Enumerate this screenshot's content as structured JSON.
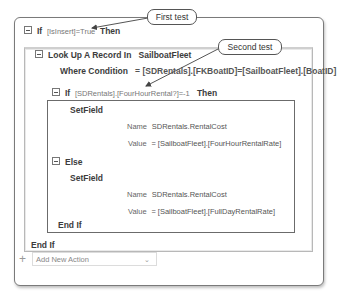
{
  "macro": {
    "if1": {
      "keyword": "If",
      "condition": "[IsInsert]=True",
      "then": "Then"
    },
    "lookup": {
      "keyword": "Look Up A Record In",
      "table": "SailboatFleet",
      "where_label": "Where Condition",
      "where_value": "= [SDRentals].[FKBoatID]=[SailboatFleet].[BoatID]"
    },
    "if2": {
      "keyword": "If",
      "condition": "[SDRentals].[FourHourRental?]=-1",
      "then": "Then"
    },
    "setfield1": {
      "action": "SetField",
      "name_label": "Name",
      "name_value": "SDRentals.RentalCost",
      "value_label": "Value",
      "value_value": "= [SailboatFleet].[FourHourRentalRate]"
    },
    "else": {
      "keyword": "Else"
    },
    "setfield2": {
      "action": "SetField",
      "name_label": "Name",
      "name_value": "SDRentals.RentalCost",
      "value_label": "Value",
      "value_value": "= [SailboatFleet].[FullDayRentalRate]"
    },
    "endif_inner": "End If",
    "endif_outer": "End If",
    "add_action": {
      "plus_icon": "+",
      "label": "Add New Action",
      "chevron": "⌄"
    }
  },
  "callouts": {
    "first": "First test",
    "second": "Second test"
  }
}
